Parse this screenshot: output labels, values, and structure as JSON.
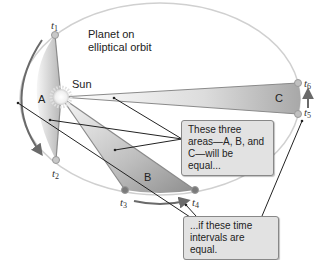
{
  "diagram": {
    "title_label": "Planet on elliptical orbit",
    "title_line1": "Planet on",
    "title_line2": "elliptical orbit",
    "sun_label": "Sun",
    "area_labels": {
      "a": "A",
      "b": "B",
      "c": "C"
    },
    "time_labels": [
      {
        "base": "t",
        "sub": "1"
      },
      {
        "base": "t",
        "sub": "2"
      },
      {
        "base": "t",
        "sub": "3"
      },
      {
        "base": "t",
        "sub": "4"
      },
      {
        "base": "t",
        "sub": "5"
      },
      {
        "base": "t",
        "sub": "6"
      }
    ],
    "callout_areas": {
      "line1": "These three",
      "line2": "areas—A, B, and",
      "line3": "C—will be equal..."
    },
    "callout_intervals": {
      "line1": "...if these time",
      "line2": "intervals are equal."
    },
    "colors": {
      "orbit": "#cfcfcf",
      "marker": "#b8b8b8",
      "marker_dark": "#7a7a7a",
      "arrow": "#6a6a6a",
      "callout_bg": "#e2e2e2",
      "leader": "#222222"
    }
  }
}
